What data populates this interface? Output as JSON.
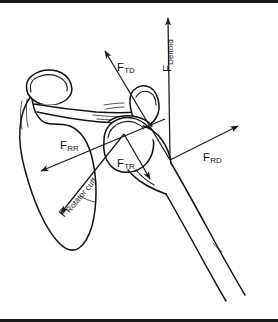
{
  "figure": {
    "domain_type": "biomechanics-force-diagram",
    "background_color": "#ffffff",
    "line_color": "#1a1a1a",
    "frame_color": "#1a1a1a"
  },
  "anatomy": {
    "structures": [
      {
        "name": "scapula",
        "label": ""
      },
      {
        "name": "acromion",
        "label": ""
      },
      {
        "name": "coracoid-process",
        "label": ""
      },
      {
        "name": "glenoid-fossa",
        "label": ""
      },
      {
        "name": "humeral-head",
        "label": ""
      },
      {
        "name": "humerus-shaft",
        "label": ""
      },
      {
        "name": "clavicle",
        "label": ""
      }
    ]
  },
  "vectors": [
    {
      "id": "ftd",
      "symbol": "F",
      "subscript": "TD",
      "full_label": "FTD",
      "description": "translational component of deltoid force",
      "direction": "up-left",
      "origin_px": [
        170,
        160
      ],
      "tip_px": [
        103,
        48
      ],
      "angle_deg": 121,
      "arrowhead": "tip"
    },
    {
      "id": "fdeltoid",
      "symbol": "F",
      "subscript": "Deltoid",
      "full_label": "FDeltoid",
      "description": "total deltoid muscle force",
      "direction": "up",
      "origin_px": [
        170,
        160
      ],
      "tip_px": [
        168,
        14
      ],
      "angle_deg": 90,
      "arrowhead": "tip",
      "label_rotation_deg": -90
    },
    {
      "id": "frr",
      "symbol": "F",
      "subscript": "RR",
      "full_label": "FRR",
      "description": "rotational component of rotator cuff force",
      "direction": "down-left",
      "origin_px": [
        163,
        120
      ],
      "tip_px": [
        38,
        172
      ],
      "angle_deg": 202,
      "arrowhead": "tip"
    },
    {
      "id": "ftr",
      "symbol": "F",
      "subscript": "TR",
      "full_label": "FTR",
      "description": "translational component of rotator cuff force",
      "direction": "down-right",
      "origin_px": [
        124,
        134
      ],
      "tip_px": [
        152,
        182
      ],
      "angle_deg": -60,
      "arrowhead": "tip"
    },
    {
      "id": "frd",
      "symbol": "F",
      "subscript": "RD",
      "full_label": "FRD",
      "description": "rotational component of deltoid force",
      "direction": "up-right",
      "origin_px": [
        170,
        160
      ],
      "tip_px": [
        240,
        125
      ],
      "angle_deg": 27,
      "arrowhead": "tip"
    },
    {
      "id": "frotator",
      "symbol": "F",
      "subscript": "Rotator cuff",
      "full_label": "FRotator cuff",
      "description": "total rotator cuff muscle force",
      "direction": "down-left",
      "origin_px": [
        124,
        134
      ],
      "tip_px": [
        58,
        216
      ],
      "angle_deg": 231,
      "arrowhead": "tip",
      "label_rotation_deg": -50
    }
  ]
}
